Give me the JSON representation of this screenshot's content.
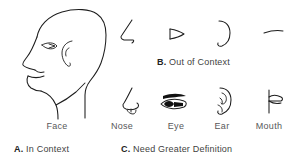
{
  "figure": {
    "ink_color": "#1d1d1d",
    "text_color": "#58585a",
    "background": "#ffffff"
  },
  "panels": {
    "a": {
      "caption_letter": "A.",
      "caption_text": "In Context",
      "items": [
        {
          "id": "face",
          "label": "Face",
          "icon": "face-profile-icon"
        }
      ]
    },
    "b": {
      "caption_letter": "B.",
      "caption_text": "Out of Context",
      "items": [
        {
          "id": "nose",
          "label": "Nose",
          "icon": "nose-simple-icon"
        },
        {
          "id": "eye",
          "label": "Eye",
          "icon": "eye-simple-icon"
        },
        {
          "id": "ear",
          "label": "Ear",
          "icon": "ear-simple-icon"
        },
        {
          "id": "mouth",
          "label": "Mouth",
          "icon": "mouth-simple-icon"
        }
      ]
    },
    "c": {
      "caption_letter": "C.",
      "caption_text": "Need Greater Definition",
      "items": [
        {
          "id": "nose",
          "label": "Nose",
          "icon": "nose-detailed-icon"
        },
        {
          "id": "eye",
          "label": "Eye",
          "icon": "eye-detailed-icon"
        },
        {
          "id": "ear",
          "label": "Ear",
          "icon": "ear-detailed-icon"
        },
        {
          "id": "mouth",
          "label": "Mouth",
          "icon": "mouth-detailed-icon"
        }
      ]
    }
  },
  "labels": {
    "face": "Face",
    "nose": "Nose",
    "eye": "Eye",
    "ear": "Ear",
    "mouth": "Mouth"
  },
  "captions": {
    "a_letter": "A.",
    "a_text": " In Context",
    "b_letter": "B.",
    "b_text": " Out of Context",
    "c_letter": "C.",
    "c_text": " Need Greater Definition"
  }
}
